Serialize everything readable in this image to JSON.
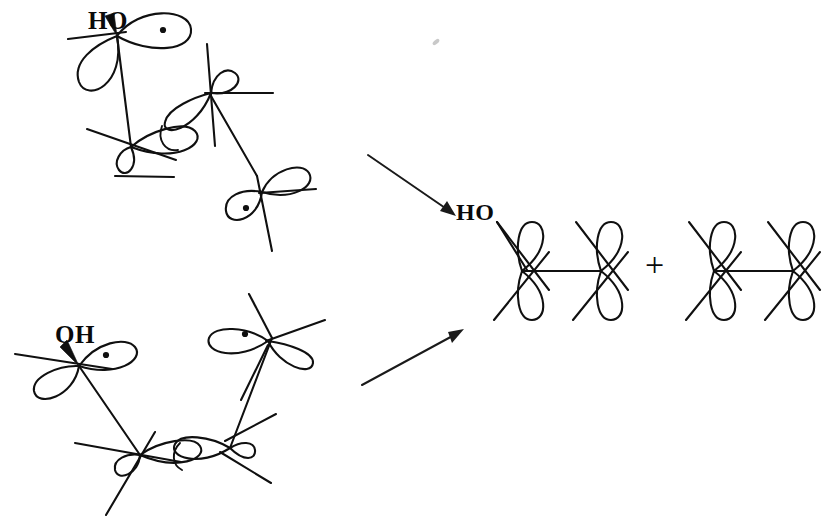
{
  "diagram": {
    "background_color": "#ffffff",
    "ink_color": "#101010",
    "width": 839,
    "height": 529
  },
  "labels": {
    "reactant_top_hydroxyl": "HO",
    "reactant_bottom_hydroxyl": "OH",
    "product_hydroxyl": "HO",
    "plus_sign": "+"
  },
  "reactants": [
    {
      "name": "top-reactant",
      "hydroxyl_label": "HO",
      "hydroxyl_bond_type": "wedge",
      "radical_count": 2,
      "radical_positions": [
        "carbon-1-upper-lobe",
        "carbon-4-lower-lobe"
      ],
      "pi_bond_between": [
        "carbon-2",
        "carbon-3"
      ],
      "carbon_count": 4
    },
    {
      "name": "bottom-reactant",
      "hydroxyl_label": "OH",
      "hydroxyl_bond_type": "wedge",
      "radical_count": 2,
      "radical_positions": [
        "carbon-1-right-lobe",
        "carbon-4-left-lobe"
      ],
      "pi_bond_between": [
        "carbon-2",
        "carbon-3"
      ],
      "carbon_count": 4
    }
  ],
  "arrows": [
    {
      "name": "top-reaction-arrow",
      "direction": "down-right",
      "x1": 368,
      "y1": 155,
      "x2": 455,
      "y2": 215
    },
    {
      "name": "bottom-reaction-arrow",
      "direction": "up-right",
      "x1": 362,
      "y1": 385,
      "x2": 462,
      "y2": 330
    }
  ],
  "products": [
    {
      "name": "product-1-hydroxy-diradical",
      "hydroxyl_label": "HO",
      "carbon_count": 2,
      "orbital_orientation": "vertical-p-orbitals",
      "sigma_bond": true
    },
    {
      "name": "product-2-diradical",
      "hydroxyl_label": "",
      "carbon_count": 2,
      "orbital_orientation": "vertical-p-orbitals",
      "sigma_bond": true
    }
  ]
}
